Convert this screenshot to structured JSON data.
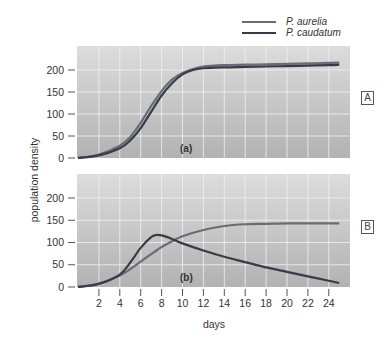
{
  "chart_data": [
    {
      "type": "line",
      "panel": "A",
      "panel_label": "(a)",
      "title": "",
      "xlabel": "days",
      "ylabel": "population density",
      "xlim": [
        0,
        26
      ],
      "ylim": [
        0,
        250
      ],
      "yticks": [
        0,
        50,
        100,
        150,
        200
      ],
      "grid": true,
      "x": [
        0,
        2,
        4,
        5,
        6,
        7,
        8,
        9,
        10,
        11,
        12,
        14,
        16,
        18,
        20,
        22,
        24,
        25
      ],
      "series": [
        {
          "name": "P. aurelia",
          "color": "#6a6a78",
          "values": [
            0,
            8,
            28,
            48,
            80,
            118,
            152,
            178,
            193,
            202,
            208,
            211,
            212,
            213,
            214,
            215,
            216,
            217
          ]
        },
        {
          "name": "P. caudatum",
          "color": "#3a3a48",
          "values": [
            0,
            6,
            22,
            40,
            68,
            105,
            142,
            170,
            190,
            200,
            204,
            206,
            207,
            208,
            209,
            210,
            211,
            212
          ]
        }
      ]
    },
    {
      "type": "line",
      "panel": "B",
      "panel_label": "(b)",
      "title": "",
      "xlabel": "days",
      "ylabel": "population density",
      "xlim": [
        0,
        26
      ],
      "ylim": [
        0,
        250
      ],
      "xticks": [
        2,
        4,
        6,
        8,
        10,
        12,
        14,
        16,
        18,
        20,
        22,
        24
      ],
      "yticks": [
        0,
        50,
        100,
        150,
        200
      ],
      "grid": true,
      "x": [
        0,
        2,
        4,
        5,
        6,
        7,
        7.5,
        8,
        9,
        10,
        12,
        14,
        16,
        18,
        20,
        22,
        24,
        25
      ],
      "series": [
        {
          "name": "P. aurelia",
          "color": "#6a6a78",
          "values": [
            0,
            8,
            26,
            40,
            57,
            74,
            82,
            90,
            103,
            114,
            128,
            137,
            141,
            142,
            143,
            143,
            143,
            143
          ]
        },
        {
          "name": "P. caudatum",
          "color": "#3a3a48",
          "values": [
            0,
            7,
            28,
            55,
            88,
            112,
            117,
            116,
            108,
            98,
            82,
            68,
            56,
            44,
            34,
            24,
            14,
            9
          ]
        }
      ]
    }
  ],
  "legend": {
    "items": [
      {
        "label": "P. aurelia",
        "color": "#6a6a78"
      },
      {
        "label": "P. caudatum",
        "color": "#3a3a48"
      }
    ]
  },
  "axes": {
    "ylabel": "population density",
    "xlabel": "days",
    "xticks": [
      "2",
      "4",
      "6",
      "8",
      "10",
      "12",
      "14",
      "16",
      "18",
      "20",
      "22",
      "24"
    ],
    "yticks": [
      "0",
      "50",
      "100",
      "150",
      "200"
    ]
  },
  "panels": {
    "a": {
      "tag": "A",
      "label": "(a)"
    },
    "b": {
      "tag": "B",
      "label": "(b)"
    }
  },
  "colors": {
    "plot_bg_top": "#dcdcdc",
    "plot_bg_bottom": "#b4b4b4",
    "grid": "#f2f2f2"
  }
}
